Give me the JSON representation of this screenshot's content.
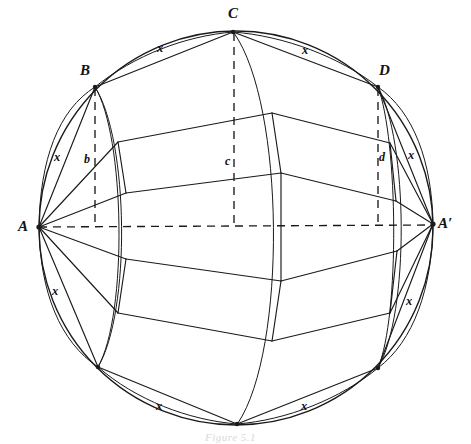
{
  "figure": {
    "caption": "Figure 5.1",
    "canvas": {
      "width": 471,
      "height": 444
    },
    "background_color": "#ffffff",
    "ink_color": "#1a1a1a"
  },
  "circle": {
    "center_x": 236,
    "center_y": 228,
    "radius": 197
  },
  "vertices": [
    {
      "id": "A",
      "label": "A",
      "x": 39,
      "y": 227,
      "label_x": 18,
      "label_y": 219
    },
    {
      "id": "Ap",
      "label": "A′",
      "x": 433,
      "y": 224,
      "label_x": 438,
      "label_y": 216
    },
    {
      "id": "C",
      "label": "C",
      "x": 233,
      "y": 32,
      "label_x": 228,
      "label_y": 8
    },
    {
      "id": "B",
      "label": "B",
      "x": 95,
      "y": 87,
      "label_x": 80,
      "label_y": 65
    },
    {
      "id": "D",
      "label": "D",
      "x": 378,
      "y": 87,
      "label_x": 380,
      "label_y": 65
    },
    {
      "id": "Cp",
      "label": "",
      "x": 237,
      "y": 424,
      "label_x": 0,
      "label_y": 0
    },
    {
      "id": "Bp",
      "label": "",
      "x": 98,
      "y": 367,
      "label_x": 0,
      "label_y": 0
    },
    {
      "id": "Dp",
      "label": "",
      "x": 378,
      "y": 368,
      "label_x": 0,
      "label_y": 0
    }
  ],
  "foot_labels": [
    {
      "id": "b",
      "label": "b",
      "x": 84,
      "y": 154
    },
    {
      "id": "c",
      "label": "c",
      "x": 225,
      "y": 156
    },
    {
      "id": "d",
      "label": "d",
      "x": 379,
      "y": 152
    }
  ],
  "edge_labels": [
    {
      "id": "x-top-left",
      "label": "x",
      "x": 157,
      "y": 43
    },
    {
      "id": "x-top-right",
      "label": "x",
      "x": 302,
      "y": 45
    },
    {
      "id": "x-left-upper",
      "label": "x",
      "x": 54,
      "y": 152
    },
    {
      "id": "x-right-upper",
      "label": "x",
      "x": 408,
      "y": 150
    },
    {
      "id": "x-left-lower",
      "label": "x",
      "x": 52,
      "y": 286
    },
    {
      "id": "x-right-lower",
      "label": "x",
      "x": 406,
      "y": 296
    },
    {
      "id": "x-bottom-left",
      "label": "x",
      "x": 156,
      "y": 401
    },
    {
      "id": "x-bottom-right",
      "label": "x",
      "x": 301,
      "y": 401
    }
  ],
  "dashed_segments": [
    {
      "id": "axis-A-to-Ap",
      "from": "A",
      "to": "A-prime",
      "x1": 39,
      "y1": 227,
      "x2": 433,
      "y2": 224
    },
    {
      "id": "drop-B-to-b",
      "from": "B",
      "to": "b",
      "x1": 95,
      "y1": 87,
      "x2": 95,
      "y2": 227
    },
    {
      "id": "drop-C-to-c",
      "from": "C",
      "to": "c",
      "x1": 234,
      "y1": 32,
      "x2": 234,
      "y2": 227
    },
    {
      "id": "drop-D-to-d",
      "from": "D",
      "to": "d",
      "x1": 378,
      "y1": 87,
      "x2": 378,
      "y2": 226
    }
  ],
  "meridians": [
    {
      "id": "meridian-through-B",
      "note": "ellipse arc through B and B-prime"
    },
    {
      "id": "meridian-through-C",
      "note": "ellipse arc through C and C-prime"
    },
    {
      "id": "meridian-through-D",
      "note": "ellipse arc through D and D-prime"
    }
  ]
}
